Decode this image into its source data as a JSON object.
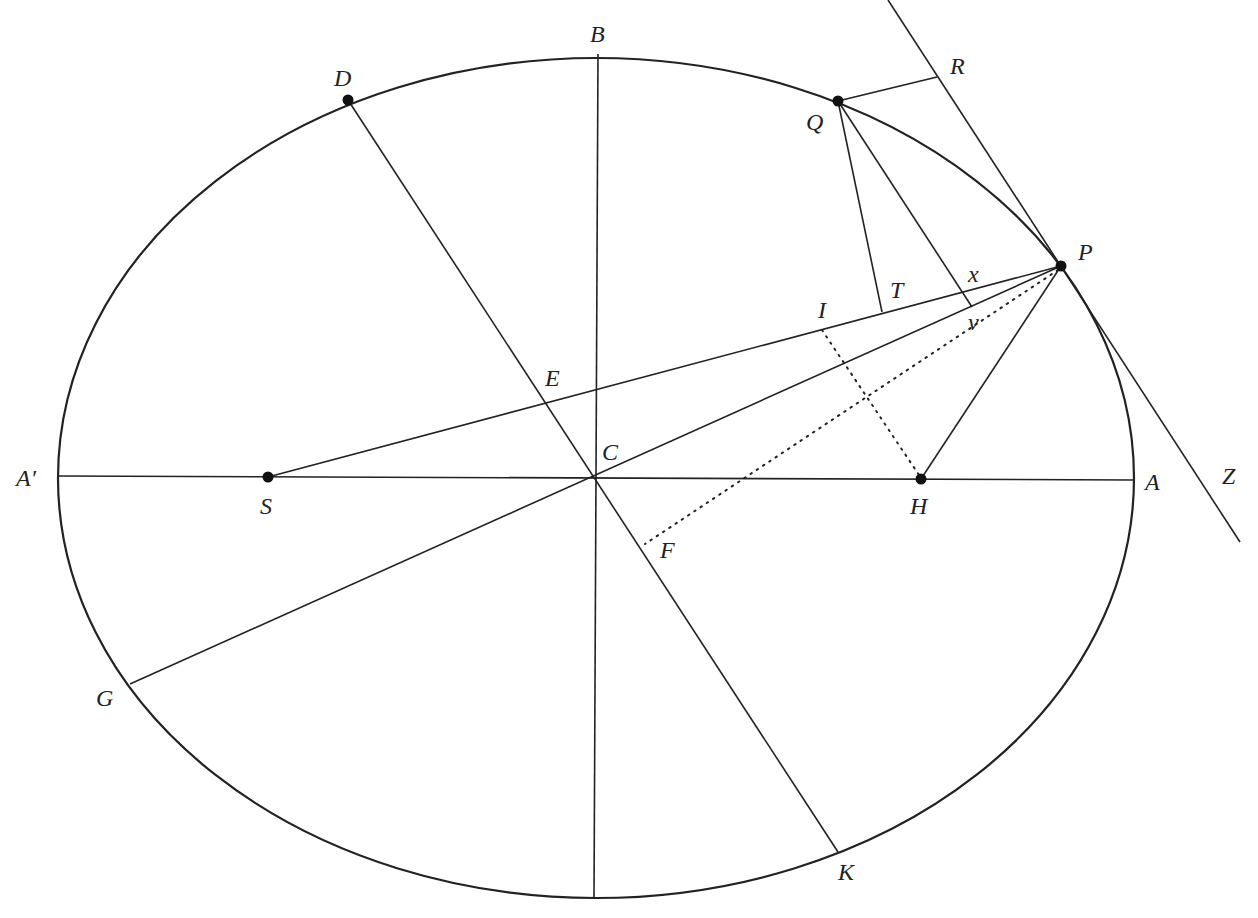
{
  "diagram": {
    "type": "ellipse-geometry-construction",
    "labels": {
      "A_prime": "A′",
      "A": "A",
      "B": "B",
      "C": "C",
      "D": "D",
      "E": "E",
      "F": "F",
      "G": "G",
      "H": "H",
      "I": "I",
      "K": "K",
      "P": "P",
      "Q": "Q",
      "R": "R",
      "S": "S",
      "T": "T",
      "v": "v",
      "x": "x",
      "Z": "Z"
    },
    "points_marked": [
      "D",
      "Q",
      "P",
      "S",
      "H"
    ],
    "elements": {
      "ellipse": "centered at C with major axis A′A and minor axis B",
      "foci": [
        "S",
        "H"
      ],
      "tangent_line": "through P and Z, passing near R",
      "diameters": [
        "DK (through C, E, F)",
        "GP (through C, v)"
      ],
      "segments": [
        "SP (through E, I, T, x)",
        "HP",
        "QT",
        "Qv",
        "QR",
        "QP arc"
      ],
      "dotted_lines": [
        "PF",
        "IH"
      ]
    }
  }
}
